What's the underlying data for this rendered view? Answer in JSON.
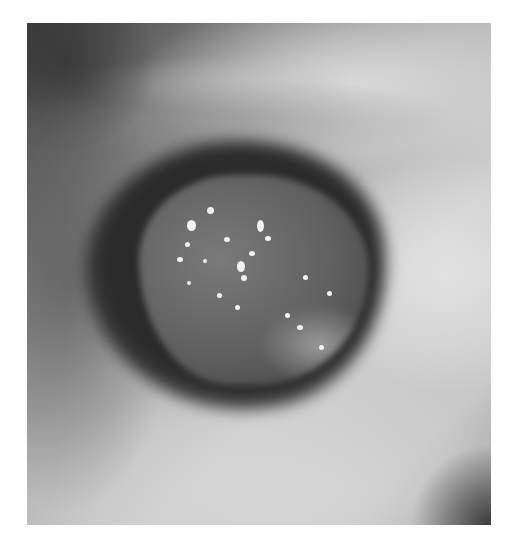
{
  "image": {
    "description": "Grayscale endoscopic view of an airway lumen containing a dark rounded mass with scattered bright white specks",
    "frame": {
      "x": 27,
      "y": 23,
      "width": 464,
      "height": 502
    },
    "colors": {
      "background": "#ffffff",
      "lumen_dark": "#2a2a2a",
      "mucosa_light": "#d6d6d6",
      "specks": "#f2f2f2"
    }
  }
}
